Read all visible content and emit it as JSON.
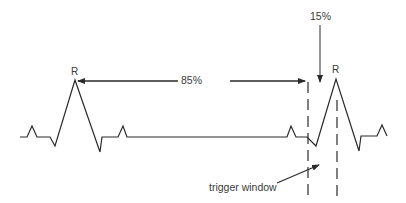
{
  "diagram": {
    "title": "",
    "colors": {
      "stroke": "#2a2a2a",
      "text": "#3a3a3a",
      "background": "#ffffff"
    },
    "labels": {
      "r_left": "R",
      "r_right": "R",
      "interval_85": "85%",
      "interval_15": "15%",
      "trigger_window": "trigger window"
    },
    "waveform": {
      "type": "ECG trace",
      "beats": 2,
      "peaks": [
        "R",
        "R"
      ]
    },
    "annotations": [
      {
        "id": "rr-85",
        "text": "85%",
        "description": "horizontal arrow from first R peak to start of trigger window"
      },
      {
        "id": "window-15",
        "text": "15%",
        "description": "vertical arrow pointing down into trigger window"
      },
      {
        "id": "trigger-window",
        "text": "trigger window",
        "description": "region between two dashed vertical lines around second R peak"
      }
    ]
  }
}
